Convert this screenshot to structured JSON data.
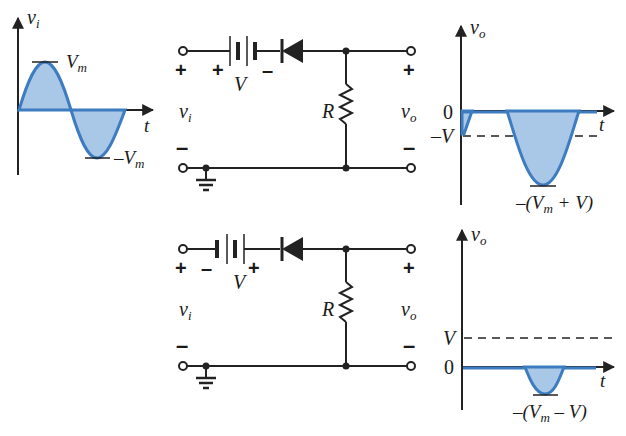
{
  "input_waveform": {
    "y_label": "v",
    "y_label_sub": "i",
    "x_label": "t",
    "peak_label": "V",
    "peak_label_sub": "m",
    "trough_label": "–V",
    "trough_label_sub": "m"
  },
  "circuits": [
    {
      "name": "circuit-1",
      "input_label": "v",
      "input_label_sub": "i",
      "output_label": "v",
      "output_label_sub": "o",
      "battery_label": "V",
      "battery_left_polarity": "+",
      "battery_right_polarity": "–",
      "input_plus": "+",
      "input_minus": "–",
      "output_plus": "+",
      "output_minus": "–",
      "resistor_label": "R"
    },
    {
      "name": "circuit-2",
      "input_label": "v",
      "input_label_sub": "i",
      "output_label": "v",
      "output_label_sub": "o",
      "battery_label": "V",
      "battery_left_polarity": "–",
      "battery_right_polarity": "+",
      "input_plus": "+",
      "input_minus": "–",
      "output_plus": "+",
      "output_minus": "–",
      "resistor_label": "R"
    }
  ],
  "output_waveforms": [
    {
      "y_label": "v",
      "y_label_sub": "o",
      "x_label": "t",
      "zero_label": "0",
      "level_label": "–V",
      "min_label_pre": "–(",
      "min_label_v": "V",
      "min_label_sub": "m",
      "min_label_post": " + V)"
    },
    {
      "y_label": "v",
      "y_label_sub": "o",
      "x_label": "t",
      "zero_label": "0",
      "level_label": "V",
      "min_label_pre": "–(",
      "min_label_v": "V",
      "min_label_sub": "m",
      "min_label_post": " – V)"
    }
  ],
  "colors": {
    "wave_stroke": "#3d7cc0",
    "wave_fill": "#a9c8e8",
    "ink": "#222222"
  }
}
